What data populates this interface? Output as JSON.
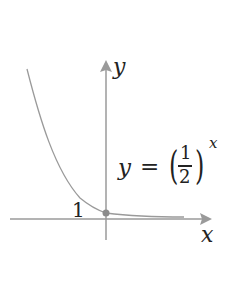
{
  "diagram": {
    "function_label": {
      "lhs": "y",
      "eq": "=",
      "numerator": "1",
      "denominator": "2",
      "exponent": "x"
    },
    "axis_labels": {
      "x": "x",
      "y": "y"
    },
    "intercept_label": "1",
    "colors": {
      "axis": "#999999",
      "curve": "#999999",
      "point": "#8c8c8c",
      "text": "#222222"
    }
  }
}
